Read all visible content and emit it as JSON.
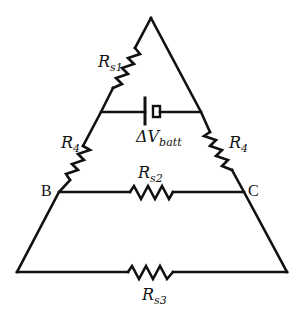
{
  "diagram": {
    "type": "circuit",
    "shape": "triangle-with-trapezoid",
    "colors": {
      "line": "#111111",
      "background": "#ffffff"
    },
    "components": {
      "rs1": {
        "kind": "resistor",
        "symbol": "R",
        "subscript": "s1",
        "location": "upper-left edge"
      },
      "r4_left": {
        "kind": "resistor",
        "symbol": "R",
        "subscript": "4",
        "location": "left edge between battery branch and B"
      },
      "r4_right": {
        "kind": "resistor",
        "symbol": "R",
        "subscript": "4",
        "location": "right edge between battery branch and C"
      },
      "battery": {
        "kind": "battery",
        "symbol": "ΔV",
        "subscript": "batt",
        "location": "horizontal branch across triangle"
      },
      "rs2": {
        "kind": "resistor",
        "symbol": "R",
        "subscript": "s2",
        "location": "horizontal branch B–C"
      },
      "rs3": {
        "kind": "resistor",
        "symbol": "R",
        "subscript": "s3",
        "location": "bottom horizontal wire"
      }
    },
    "nodes": {
      "b": {
        "label": "B"
      },
      "c": {
        "label": "C"
      }
    }
  }
}
